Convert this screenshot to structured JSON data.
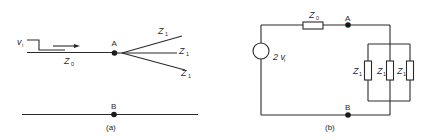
{
  "panel_a": {
    "caption": "(a)",
    "source_label": "v",
    "source_sub": "i",
    "line_label": "Z",
    "line_sub": "0",
    "node_a": "A",
    "node_b": "B",
    "branches": [
      {
        "label": "Z",
        "sub": "1"
      },
      {
        "label": "Z",
        "sub": "1"
      },
      {
        "label": "Z",
        "sub": "1"
      }
    ]
  },
  "panel_b": {
    "caption": "(b)",
    "source_label": "2 v",
    "source_sub": "i",
    "series_label": "Z",
    "series_sub": "0",
    "node_a": "A",
    "node_b": "B",
    "loads": [
      {
        "label": "Z",
        "sub": "1"
      },
      {
        "label": "Z",
        "sub": "1"
      },
      {
        "label": "Z",
        "sub": "1"
      }
    ]
  }
}
